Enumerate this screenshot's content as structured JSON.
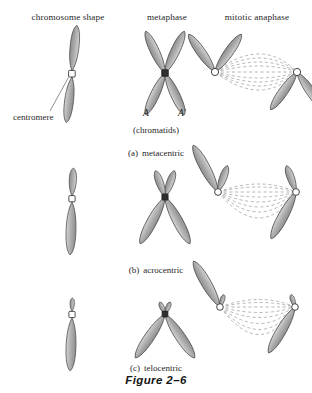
{
  "figure": {
    "number": "Figure 2–6",
    "columns": [
      {
        "id": "chromosome-shape",
        "label": "chromosome shape"
      },
      {
        "id": "metaphase",
        "label": "metaphase"
      },
      {
        "id": "mitotic-anaphase",
        "label": "mitotic anaphase"
      }
    ],
    "annotations": {
      "centromere": "centromere",
      "chromatid_a": "A",
      "chromatid_a_prime": "A′",
      "chromatids": "(chromatids)"
    },
    "rows": [
      {
        "id": "metacentric",
        "marker": "(a)",
        "label": "metacentric"
      },
      {
        "id": "acrocentric",
        "marker": "(b)",
        "label": "acrocentric"
      },
      {
        "id": "telocentric",
        "marker": "(c)",
        "label": "telocentric"
      }
    ],
    "colors": {
      "background": "#ffffff",
      "text": "#1f1f1f",
      "chromatid_fill": "#a8a8a8",
      "chromatid_fill_light": "#c9c9c9",
      "chromatid_outline": "#4d4d4d",
      "centromere_fill": "#ffffff",
      "centromere_outline": "#3a3a3a",
      "spindle_fiber": "#9a9a9a",
      "leader_line": "#6b6b6b"
    }
  }
}
